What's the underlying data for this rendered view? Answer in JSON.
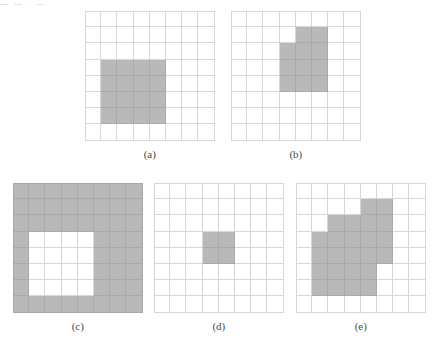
{
  "figure": {
    "top_fragment": "—   —  ·        —",
    "grid_size": 8,
    "fill_color": "#b9b9b9",
    "line_color": "#d7d7d7",
    "fill_line_color": "#a9a9a9",
    "background_color": "#ffffff",
    "panels": [
      {
        "id": "a",
        "caption": "(a)",
        "left": 85,
        "top": 11,
        "cell": 16.2,
        "description": "8x8 grid with a solid 4x4 shaded square",
        "filled_cells": [
          [
            3,
            1
          ],
          [
            3,
            2
          ],
          [
            3,
            3
          ],
          [
            3,
            4
          ],
          [
            4,
            1
          ],
          [
            4,
            2
          ],
          [
            4,
            3
          ],
          [
            4,
            4
          ],
          [
            5,
            1
          ],
          [
            5,
            2
          ],
          [
            5,
            3
          ],
          [
            5,
            4
          ],
          [
            6,
            1
          ],
          [
            6,
            2
          ],
          [
            6,
            3
          ],
          [
            6,
            4
          ]
        ]
      },
      {
        "id": "b",
        "caption": "(b)",
        "left": 231,
        "top": 11,
        "cell": 16.2,
        "description": "8x8 grid with a stepped block: 2 cells on top row and a 3x3 block below",
        "filled_cells": [
          [
            1,
            4
          ],
          [
            1,
            5
          ],
          [
            2,
            3
          ],
          [
            2,
            4
          ],
          [
            2,
            5
          ],
          [
            3,
            3
          ],
          [
            3,
            4
          ],
          [
            3,
            5
          ],
          [
            4,
            3
          ],
          [
            4,
            4
          ],
          [
            4,
            5
          ]
        ]
      },
      {
        "id": "c",
        "caption": "(c)",
        "left": 13,
        "top": 183,
        "cell": 16.2,
        "description": "8x8 grid fully shaded with a white 4x4 hole",
        "filled_cells": [
          [
            0,
            0
          ],
          [
            0,
            1
          ],
          [
            0,
            2
          ],
          [
            0,
            3
          ],
          [
            0,
            4
          ],
          [
            0,
            5
          ],
          [
            0,
            6
          ],
          [
            0,
            7
          ],
          [
            1,
            0
          ],
          [
            1,
            1
          ],
          [
            1,
            2
          ],
          [
            1,
            3
          ],
          [
            1,
            4
          ],
          [
            1,
            5
          ],
          [
            1,
            6
          ],
          [
            1,
            7
          ],
          [
            2,
            0
          ],
          [
            2,
            1
          ],
          [
            2,
            2
          ],
          [
            2,
            3
          ],
          [
            2,
            4
          ],
          [
            2,
            5
          ],
          [
            2,
            6
          ],
          [
            2,
            7
          ],
          [
            3,
            0
          ],
          [
            3,
            5
          ],
          [
            3,
            6
          ],
          [
            3,
            7
          ],
          [
            4,
            0
          ],
          [
            4,
            5
          ],
          [
            4,
            6
          ],
          [
            4,
            7
          ],
          [
            5,
            0
          ],
          [
            5,
            5
          ],
          [
            5,
            6
          ],
          [
            5,
            7
          ],
          [
            6,
            0
          ],
          [
            6,
            5
          ],
          [
            6,
            6
          ],
          [
            6,
            7
          ],
          [
            7,
            0
          ],
          [
            7,
            1
          ],
          [
            7,
            2
          ],
          [
            7,
            3
          ],
          [
            7,
            4
          ],
          [
            7,
            5
          ],
          [
            7,
            6
          ],
          [
            7,
            7
          ]
        ]
      },
      {
        "id": "d",
        "caption": "(d)",
        "left": 154,
        "top": 183,
        "cell": 16.2,
        "description": "8x8 grid with a small 2x2 shaded square near the centre",
        "filled_cells": [
          [
            3,
            3
          ],
          [
            3,
            4
          ],
          [
            4,
            3
          ],
          [
            4,
            4
          ]
        ]
      },
      {
        "id": "e",
        "caption": "(e)",
        "left": 296,
        "top": 183,
        "cell": 16.2,
        "description": "8x8 grid with a staircase-shaped shaded region",
        "filled_cells": [
          [
            1,
            4
          ],
          [
            1,
            5
          ],
          [
            2,
            2
          ],
          [
            2,
            3
          ],
          [
            2,
            4
          ],
          [
            2,
            5
          ],
          [
            3,
            1
          ],
          [
            3,
            2
          ],
          [
            3,
            3
          ],
          [
            3,
            4
          ],
          [
            3,
            5
          ],
          [
            4,
            1
          ],
          [
            4,
            2
          ],
          [
            4,
            3
          ],
          [
            4,
            4
          ],
          [
            4,
            5
          ],
          [
            5,
            1
          ],
          [
            5,
            2
          ],
          [
            5,
            3
          ],
          [
            5,
            4
          ],
          [
            6,
            1
          ],
          [
            6,
            2
          ],
          [
            6,
            3
          ],
          [
            6,
            4
          ]
        ]
      }
    ]
  }
}
